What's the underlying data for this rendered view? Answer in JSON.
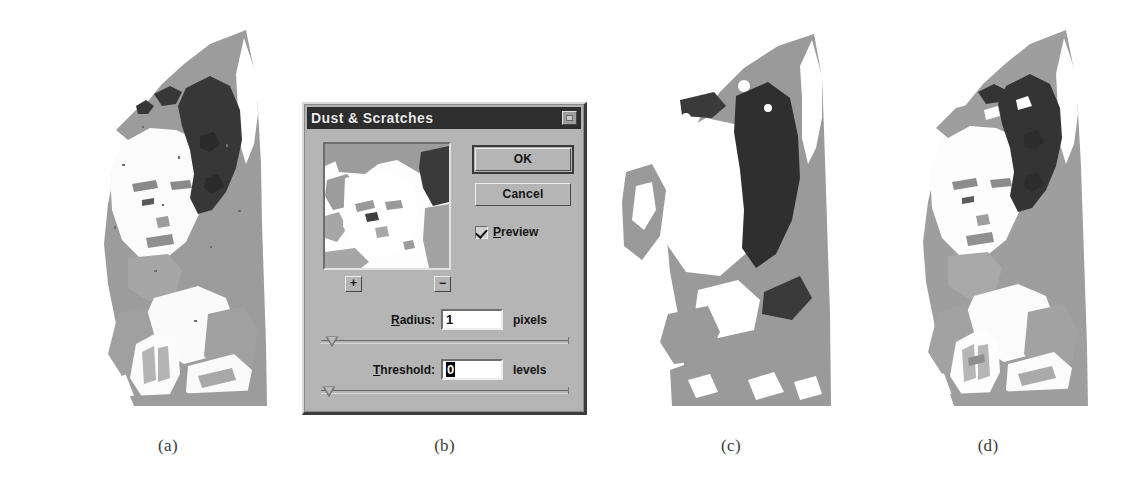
{
  "figure": {
    "background_color": "#ffffff",
    "caption_color": "#3a3a3a"
  },
  "panels": [
    {
      "id": "a",
      "caption": "(a)",
      "description": "Original posterized scan of a praying child with heavy dust and scratch speckle"
    },
    {
      "id": "b",
      "caption": "(b)",
      "description": "Photoshop Dust & Scratches filter dialog"
    },
    {
      "id": "c",
      "caption": "(c)",
      "description": "Result with large radius - detail lost, image reduced to blobs"
    },
    {
      "id": "d",
      "caption": "(d)",
      "description": "Result with small radius - speckle removed, detail preserved"
    }
  ],
  "dialog": {
    "title": "Dust & Scratches",
    "close_button": "close-box",
    "buttons": {
      "ok": "OK",
      "cancel": "Cancel"
    },
    "preview": {
      "label_prefix": "P",
      "label_rest": "review",
      "checked": true
    },
    "zoom_buttons": {
      "plus": "+",
      "minus": "−"
    },
    "params": [
      {
        "id": "radius",
        "label_prefix": "R",
        "label_rest": "adius:",
        "value": "1",
        "suffix": "pixels",
        "slider_percent": 2,
        "selected": false
      },
      {
        "id": "threshold",
        "label_prefix": "T",
        "label_rest": "hreshold:",
        "value": "0",
        "suffix": "levels",
        "slider_percent": 1,
        "selected": true
      }
    ],
    "colors": {
      "face": "#b5b5b5",
      "titlebar": "#2e2e2e",
      "titlebar_text": "#ededed",
      "shadow": "#3c3c3c",
      "highlight": "#d9d9d9"
    }
  }
}
